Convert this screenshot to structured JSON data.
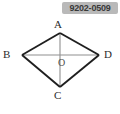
{
  "image": {
    "width": 120,
    "height": 114,
    "background_color": "#ffffff"
  },
  "badge": {
    "id_text": "9202-0509",
    "background_color": "#b9b9b9",
    "text_color": "#3a3a3a"
  },
  "figure": {
    "stroke_color_outline": "#1f1f1f",
    "stroke_color_diagonal": "#8a8a8a",
    "labels": {
      "top": "A",
      "left": "B",
      "right": "D",
      "bottom": "C",
      "center": "O"
    },
    "points": {
      "A": {
        "x": 60,
        "y": 19
      },
      "B": {
        "x": 22,
        "y": 41
      },
      "C": {
        "x": 60,
        "y": 73
      },
      "D": {
        "x": 99,
        "y": 41
      },
      "O": {
        "x": 60,
        "y": 41
      }
    },
    "edges": [
      {
        "name": "A-B",
        "from": "A",
        "to": "B",
        "kind": "outline"
      },
      {
        "name": "A-D",
        "from": "A",
        "to": "D",
        "kind": "outline"
      },
      {
        "name": "B-C",
        "from": "B",
        "to": "C",
        "kind": "outline"
      },
      {
        "name": "C-D",
        "from": "C",
        "to": "D",
        "kind": "outline"
      },
      {
        "name": "A-C",
        "from": "A",
        "to": "C",
        "kind": "diagonal"
      },
      {
        "name": "B-D",
        "from": "B",
        "to": "D",
        "kind": "diagonal"
      }
    ]
  }
}
